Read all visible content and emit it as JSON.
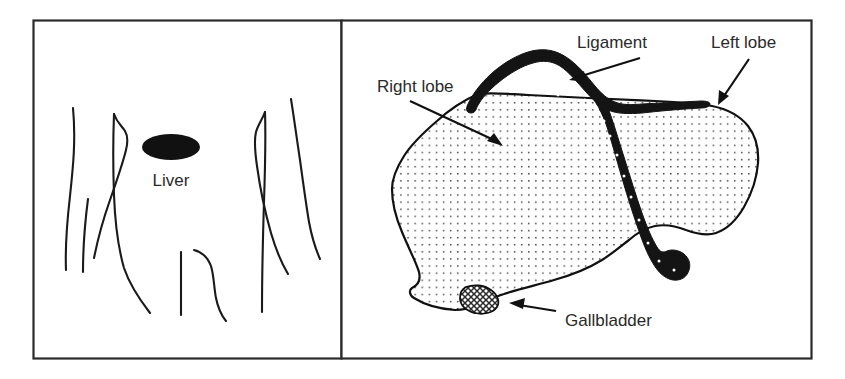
{
  "figure": {
    "background_color": "#ffffff",
    "ink_color": "#111111",
    "border_color": "#2b2b2b",
    "width": 845,
    "height": 379
  },
  "left_panel": {
    "name": "body-location-panel",
    "caption": "Liver",
    "organ_marker": {
      "shape": "filled-ellipse",
      "color": "#111111",
      "cx": 171,
      "cy": 147,
      "rx": 29,
      "ry": 13
    },
    "torso_outline_description": "abdominal contour sketch lines"
  },
  "right_panel": {
    "name": "liver-detail-panel",
    "labels": [
      {
        "id": "right-lobe",
        "text": "Right lobe",
        "text_x": 377,
        "text_y": 92,
        "leader_from": [
          455,
          101
        ],
        "leader_to": [
          499,
          144
        ],
        "arrow_angle_deg": 44
      },
      {
        "id": "ligament",
        "text": "Ligament",
        "text_x": 577,
        "text_y": 48,
        "leader_from": [
          625,
          64
        ],
        "leader_to": [
          573,
          78
        ],
        "arrow_angle_deg": 195
      },
      {
        "id": "left-lobe",
        "text": "Left lobe",
        "text_x": 711,
        "text_y": 48,
        "leader_from": [
          752,
          66
        ],
        "leader_to": [
          722,
          103
        ],
        "arrow_angle_deg": 129
      },
      {
        "id": "gallbladder",
        "text": "Gallbladder",
        "text_x": 565,
        "text_y": 326,
        "leader_from": [
          556,
          308
        ],
        "leader_to": [
          512,
          303
        ],
        "arrow_angle_deg": 186
      }
    ],
    "structures": [
      {
        "id": "liver-body",
        "fill": "stipple-dots",
        "stroke": "#111111"
      },
      {
        "id": "falciform-ligament",
        "fill": "#141414",
        "note": "dark Y-shaped band across the superior surface"
      },
      {
        "id": "gallbladder-sac",
        "fill": "crosshatch",
        "stroke": "#111111"
      }
    ]
  }
}
